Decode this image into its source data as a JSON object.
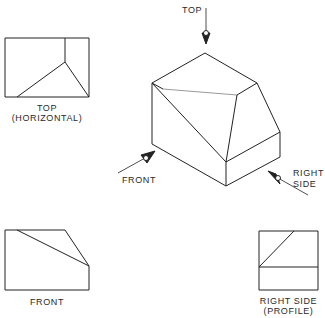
{
  "figure": {
    "pictorial": {
      "arrows": {
        "top": "TOP",
        "front": "FRONT",
        "right_side_line1": "RIGHT",
        "right_side_line2": "SIDE"
      }
    },
    "views": {
      "top": {
        "line1": "TOP",
        "line2": "(HORIZONTAL)"
      },
      "front": {
        "line1": "FRONT"
      },
      "right_side": {
        "line1": "RIGHT SIDE",
        "line2": "(PROFILE)"
      }
    }
  },
  "colors": {
    "line": "#222222",
    "background": "#ffffff"
  }
}
